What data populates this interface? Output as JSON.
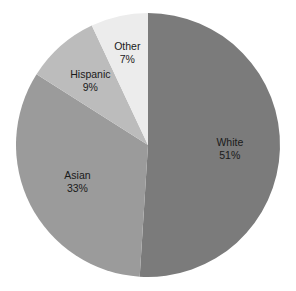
{
  "chart_data": {
    "type": "pie",
    "title": "",
    "categories": [
      "White",
      "Asian",
      "Hispanic",
      "Other"
    ],
    "values": [
      51,
      33,
      9,
      7
    ],
    "unit": "%",
    "start_angle": "12 o'clock",
    "direction": "clockwise",
    "legend": "none (labels inside slices)",
    "colors": [
      "#7b7b7b",
      "#9b9b9b",
      "#bcbcbc",
      "#ececec"
    ],
    "labels": [
      {
        "name": "White",
        "value_label": "51%"
      },
      {
        "name": "Asian",
        "value_label": "33%"
      },
      {
        "name": "Hispanic",
        "value_label": "9%"
      },
      {
        "name": "Other",
        "value_label": "7%"
      }
    ]
  },
  "layout": {
    "cx": 148,
    "cy": 145,
    "r": 132
  }
}
